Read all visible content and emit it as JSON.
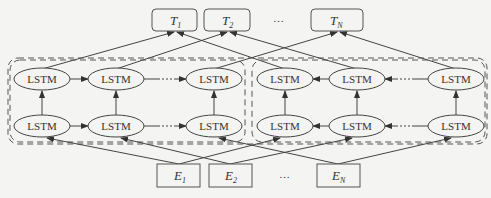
{
  "diagram": {
    "outputs": [
      {
        "label": "T",
        "sub": "1"
      },
      {
        "label": "T",
        "sub": "2"
      },
      {
        "label": "T",
        "sub": "N"
      }
    ],
    "inputs": [
      {
        "label": "E",
        "sub": "1"
      },
      {
        "label": "E",
        "sub": "2"
      },
      {
        "label": "E",
        "sub": "N"
      }
    ],
    "ellipsis": "…",
    "cell_label": "LSTM",
    "groups": [
      {
        "name": "forward-group",
        "cells_top": [
          "LSTM",
          "LSTM",
          "LSTM"
        ],
        "cells_bottom": [
          "LSTM",
          "LSTM",
          "LSTM"
        ],
        "direction": "left-to-right"
      },
      {
        "name": "backward-group",
        "cells_top": [
          "LSTM",
          "LSTM",
          "LSTM"
        ],
        "cells_bottom": [
          "LSTM",
          "LSTM",
          "LSTM"
        ],
        "direction": "right-to-left"
      }
    ],
    "colors": {
      "stroke": "#444444",
      "dash": "#555555",
      "background": "#f4f4f2"
    }
  }
}
